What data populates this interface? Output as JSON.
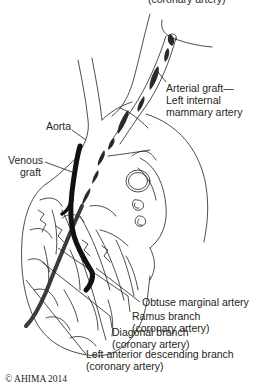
{
  "figure": {
    "title_partial": "(coronary artery)",
    "labels": {
      "arterial_graft": {
        "line1": "Arterial graft—",
        "line2": "Left internal",
        "line3": "mammary artery"
      },
      "aorta": "Aorta",
      "venous_graft": {
        "line1": "Venous",
        "line2": "graft"
      },
      "obtuse_marginal": "Obtuse marginal artery",
      "ramus_branch": {
        "line1": "Ramus branch",
        "line2": "(coronary artery)"
      },
      "diagonal_branch": {
        "line1": "Diagonal branch",
        "line2": "(coronary artery)"
      },
      "lad_branch": {
        "line1": "Left anterior descending branch",
        "line2": "(coronary artery)"
      }
    },
    "copyright": "© AHIMA 2014",
    "colors": {
      "line": "#231f20",
      "graft_fill": "#1a1a1a",
      "artery_fill": "#3a3a3a",
      "background": "#ffffff"
    }
  }
}
